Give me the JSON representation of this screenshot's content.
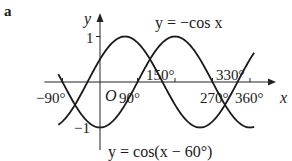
{
  "panel_label": "a",
  "chart_data": {
    "type": "line",
    "title": "",
    "xlabel": "x",
    "ylabel": "y",
    "origin_label": "O",
    "xlim": [
      -100,
      375
    ],
    "ylim": [
      -1,
      1
    ],
    "grid": false,
    "x_ticks": [
      {
        "value": -90,
        "label": "−90°"
      },
      {
        "value": 90,
        "label": "90°"
      },
      {
        "value": 180,
        "label": ""
      },
      {
        "value": 270,
        "label": "270°"
      },
      {
        "value": 360,
        "label": "360°"
      }
    ],
    "y_ticks": [
      {
        "value": 1,
        "label": "1"
      },
      {
        "value": -1,
        "label": "−1"
      }
    ],
    "series": [
      {
        "name": "y = −cos x",
        "function": "-cos(x)",
        "x_range": [
          -100,
          370
        ]
      },
      {
        "name": "y = cos(x − 60°)",
        "function": "cos(x-60)",
        "x_range": [
          -100,
          370
        ]
      }
    ],
    "annotations": [
      {
        "text": "150°",
        "x": 150,
        "note": "intersection"
      },
      {
        "text": "330°",
        "x": 330,
        "note": "intersection"
      }
    ],
    "legend": "inline labels"
  }
}
